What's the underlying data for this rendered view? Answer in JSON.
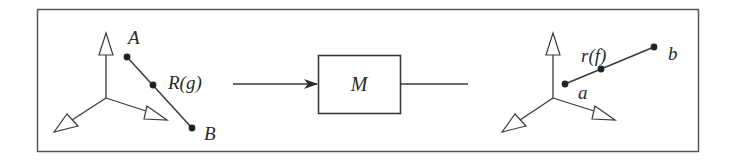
{
  "diagram": {
    "left_frame": {
      "points": {
        "start": "A",
        "end": "B"
      },
      "segment_label": "R(g)"
    },
    "operator": {
      "label": "M"
    },
    "right_frame": {
      "points": {
        "start": "a",
        "end": "b"
      },
      "segment_label": "r(f)"
    },
    "colors": {
      "line": "#3a3a3a",
      "text": "#2a2a2a",
      "background": "#ffffff"
    }
  }
}
